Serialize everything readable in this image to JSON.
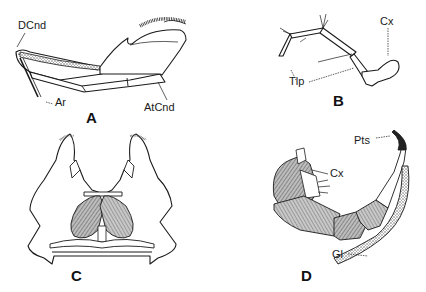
{
  "figure": {
    "panels": [
      {
        "id": "A",
        "label": "A",
        "annotations": [
          {
            "text": "DCnd"
          },
          {
            "text": "Ar"
          },
          {
            "text": "AtCnd"
          }
        ]
      },
      {
        "id": "B",
        "label": "B",
        "annotations": [
          {
            "text": "Cx"
          },
          {
            "text": "Tlp"
          }
        ]
      },
      {
        "id": "C",
        "label": "C",
        "annotations": []
      },
      {
        "id": "D",
        "label": "D",
        "annotations": [
          {
            "text": "Pts"
          },
          {
            "text": "Cx"
          },
          {
            "text": "Gl"
          }
        ]
      }
    ]
  },
  "colors": {
    "ink": "#1a1a1a",
    "stipple": "#9a9a9a",
    "background": "#ffffff"
  }
}
